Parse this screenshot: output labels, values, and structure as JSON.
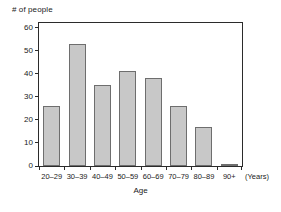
{
  "chart_data": {
    "type": "bar",
    "title": "",
    "subtitle": "",
    "xlabel": "Age",
    "ylabel": "# of people",
    "x_units_label": "(Years)",
    "categories": [
      "20–29",
      "30–39",
      "40–49",
      "50–59",
      "60–69",
      "70–79",
      "80–89",
      "90+"
    ],
    "values": [
      26,
      53,
      35,
      41,
      38,
      26,
      17,
      1
    ],
    "ylim": [
      0,
      62
    ],
    "y_ticks": [
      0,
      10,
      20,
      30,
      40,
      50,
      60
    ],
    "y_tick_labels": [
      "0",
      "10",
      "20",
      "30",
      "40",
      "50",
      "60"
    ],
    "grid": false,
    "legend": null,
    "colors": {
      "bar_fill": "#c8c8c8",
      "bar_edge": "#6e6e6e",
      "axis": "#2b2b2b",
      "text": "#1a1a1a",
      "background": "#ffffff"
    }
  }
}
